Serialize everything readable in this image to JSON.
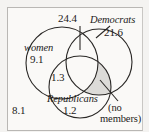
{
  "figure": {
    "kind": "three-circle-venn-diagram",
    "background_color": "#f4f3f1",
    "panel_color": "#faf9f7",
    "frame_color": "#b9b7b4",
    "stroke_color": "#2a2826",
    "shade_color": "#dcdbd8"
  },
  "sets": {
    "women": {
      "label": "women",
      "value": "9.1"
    },
    "democrats": {
      "label": "Democrats",
      "value": "21.6"
    },
    "republicans": {
      "label": "Republicans",
      "value": "1.2"
    }
  },
  "regions": {
    "women_and_democrats": {
      "value": "24.4"
    },
    "women_and_republicans": {
      "value": "1.3"
    },
    "democrats_and_republicans": {
      "label_line1": "(no",
      "label_line2": "members)",
      "value": "0"
    },
    "outside_all": {
      "value": "8.1"
    }
  },
  "annotations": {
    "leader_to_women_democrats": "24.4",
    "tick_on_democrats": "21.6",
    "leader_to_shaded": "(no members)"
  }
}
